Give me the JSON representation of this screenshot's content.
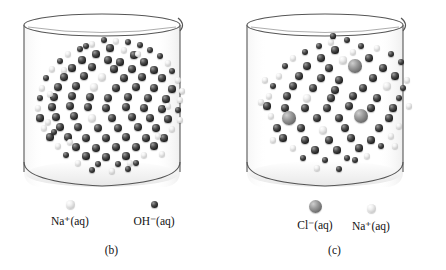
{
  "figure": {
    "type": "chemistry-illustration",
    "background_color": "#ffffff"
  },
  "panels": [
    {
      "id": "b",
      "caption": "(b)",
      "beaker": {
        "label": "beaker",
        "outline_color": "#3a3a3a",
        "fill_color": "#ffffff"
      },
      "legend": [
        {
          "label": "Na",
          "charge": "+",
          "state": "(aq)",
          "text": "Na⁺(aq)",
          "style": "light",
          "size": 9
        },
        {
          "label": "OH",
          "charge": "−",
          "state": "(aq)",
          "text": "OH⁻(aq)",
          "style": "dark",
          "size": 7
        }
      ],
      "particles": {
        "dark_count": 88,
        "light_count": 26,
        "arrangement": "dense circular cluster suspended in upper portion of beaker"
      }
    },
    {
      "id": "c",
      "caption": "(c)",
      "beaker": {
        "label": "beaker",
        "outline_color": "#3a3a3a",
        "fill_color": "#ffffff"
      },
      "legend": [
        {
          "label": "Cl",
          "charge": "−",
          "state": "(aq)",
          "text": "Cl⁻(aq)",
          "style": "gray",
          "size": 13
        },
        {
          "label": "Na",
          "charge": "+",
          "state": "(aq)",
          "text": "Na⁺(aq)",
          "style": "light",
          "size": 9
        }
      ],
      "particles": {
        "dark_count": 62,
        "light_count": 14,
        "large_gray_count": 4,
        "arrangement": "circular cluster with a few large chloride ions among smaller particles"
      }
    }
  ],
  "chart_data": {
    "type": "scatter",
    "title": "",
    "xlabel": "",
    "ylabel": "",
    "series": [
      {
        "name": "OH⁻(aq)",
        "panel": "b",
        "style": "dark",
        "count": 88,
        "radius_px": 3.5
      },
      {
        "name": "Na⁺(aq)",
        "panel": "b",
        "style": "light",
        "count": 26,
        "radius_px": 4.0
      },
      {
        "name": "Cl⁻(aq)",
        "panel": "c",
        "style": "gray",
        "count": 4,
        "radius_px": 6.5
      },
      {
        "name": "Cl⁻(aq) small",
        "panel": "c",
        "style": "dark",
        "count": 62,
        "radius_px": 3.8
      },
      {
        "name": "Na⁺(aq)",
        "panel": "c",
        "style": "light",
        "count": 14,
        "radius_px": 4.2
      }
    ],
    "points_b": [
      [
        84,
        4,
        "d",
        3.4
      ],
      [
        96,
        5,
        "l",
        3.0
      ],
      [
        108,
        6,
        "d",
        3.2
      ],
      [
        72,
        8,
        "l",
        2.8
      ],
      [
        120,
        9,
        "d",
        3.4
      ],
      [
        60,
        13,
        "d",
        3.4
      ],
      [
        90,
        12,
        "d",
        3.6
      ],
      [
        104,
        14,
        "l",
        3.2
      ],
      [
        130,
        14,
        "d",
        3.4
      ],
      [
        48,
        18,
        "l",
        3.0
      ],
      [
        76,
        18,
        "d",
        3.6
      ],
      [
        114,
        19,
        "d",
        3.6
      ],
      [
        140,
        20,
        "d",
        3.4
      ],
      [
        40,
        25,
        "d",
        3.2
      ],
      [
        62,
        24,
        "d",
        3.6
      ],
      [
        88,
        24,
        "d",
        3.8
      ],
      [
        100,
        26,
        "d",
        3.6
      ],
      [
        124,
        26,
        "d",
        3.6
      ],
      [
        148,
        27,
        "l",
        3.2
      ],
      [
        32,
        33,
        "l",
        3.0
      ],
      [
        52,
        32,
        "d",
        3.6
      ],
      [
        72,
        31,
        "d",
        3.8
      ],
      [
        94,
        33,
        "d",
        3.6
      ],
      [
        112,
        33,
        "d",
        3.8
      ],
      [
        134,
        34,
        "d",
        3.6
      ],
      [
        152,
        35,
        "d",
        3.4
      ],
      [
        26,
        42,
        "d",
        3.2
      ],
      [
        44,
        41,
        "d",
        3.8
      ],
      [
        64,
        40,
        "d",
        3.8
      ],
      [
        82,
        41,
        "l",
        4.2
      ],
      [
        104,
        42,
        "d",
        3.8
      ],
      [
        122,
        41,
        "d",
        3.8
      ],
      [
        142,
        42,
        "d",
        3.6
      ],
      [
        158,
        44,
        "l",
        3.2
      ],
      [
        22,
        52,
        "l",
        3.0
      ],
      [
        38,
        51,
        "d",
        3.8
      ],
      [
        56,
        50,
        "d",
        3.8
      ],
      [
        74,
        51,
        "l",
        4.4
      ],
      [
        96,
        52,
        "d",
        3.8
      ],
      [
        116,
        51,
        "d",
        3.8
      ],
      [
        134,
        52,
        "d",
        3.8
      ],
      [
        152,
        53,
        "d",
        3.6
      ],
      [
        20,
        62,
        "d",
        3.4
      ],
      [
        34,
        61,
        "d",
        3.8
      ],
      [
        52,
        60,
        "d",
        4.0
      ],
      [
        70,
        61,
        "d",
        4.0
      ],
      [
        88,
        62,
        "d",
        4.0
      ],
      [
        108,
        61,
        "d",
        3.8
      ],
      [
        128,
        62,
        "d",
        3.8
      ],
      [
        146,
        63,
        "d",
        3.6
      ],
      [
        160,
        64,
        "l",
        3.0
      ],
      [
        18,
        72,
        "l",
        3.2
      ],
      [
        32,
        71,
        "d",
        3.8
      ],
      [
        50,
        70,
        "d",
        4.0
      ],
      [
        68,
        71,
        "d",
        4.0
      ],
      [
        86,
        72,
        "d",
        4.0
      ],
      [
        106,
        71,
        "d",
        4.0
      ],
      [
        124,
        72,
        "d",
        3.8
      ],
      [
        142,
        73,
        "d",
        3.8
      ],
      [
        158,
        74,
        "d",
        3.4
      ],
      [
        20,
        82,
        "d",
        3.6
      ],
      [
        36,
        81,
        "d",
        3.8
      ],
      [
        54,
        80,
        "d",
        4.0
      ],
      [
        72,
        82,
        "l",
        4.4
      ],
      [
        92,
        82,
        "d",
        4.0
      ],
      [
        112,
        81,
        "d",
        4.0
      ],
      [
        130,
        82,
        "d",
        3.8
      ],
      [
        148,
        83,
        "d",
        3.6
      ],
      [
        24,
        92,
        "l",
        3.2
      ],
      [
        40,
        91,
        "d",
        3.8
      ],
      [
        58,
        91,
        "d",
        4.0
      ],
      [
        78,
        92,
        "d",
        4.0
      ],
      [
        98,
        92,
        "d",
        4.0
      ],
      [
        118,
        91,
        "d",
        3.8
      ],
      [
        136,
        92,
        "d",
        3.8
      ],
      [
        152,
        93,
        "l",
        3.2
      ],
      [
        30,
        101,
        "d",
        3.6
      ],
      [
        48,
        101,
        "d",
        3.8
      ],
      [
        66,
        102,
        "d",
        4.0
      ],
      [
        86,
        102,
        "d",
        4.0
      ],
      [
        106,
        101,
        "d",
        3.8
      ],
      [
        126,
        102,
        "d",
        3.8
      ],
      [
        144,
        102,
        "d",
        3.6
      ],
      [
        38,
        110,
        "l",
        3.2
      ],
      [
        56,
        111,
        "d",
        3.8
      ],
      [
        76,
        112,
        "d",
        3.8
      ],
      [
        96,
        111,
        "d",
        3.8
      ],
      [
        116,
        111,
        "d",
        3.8
      ],
      [
        134,
        110,
        "d",
        3.6
      ],
      [
        46,
        119,
        "d",
        3.4
      ],
      [
        66,
        120,
        "d",
        3.6
      ],
      [
        86,
        121,
        "d",
        3.6
      ],
      [
        106,
        120,
        "d",
        3.6
      ],
      [
        124,
        119,
        "l",
        3.2
      ],
      [
        58,
        127,
        "l",
        3.0
      ],
      [
        78,
        128,
        "d",
        3.4
      ],
      [
        98,
        128,
        "d",
        3.4
      ],
      [
        116,
        127,
        "d",
        3.2
      ],
      [
        72,
        134,
        "d",
        3.0
      ],
      [
        92,
        135,
        "l",
        2.8
      ],
      [
        108,
        133,
        "d",
        3.0
      ],
      [
        30,
        58,
        "l",
        3.0
      ],
      [
        44,
        34,
        "l",
        3.0
      ],
      [
        148,
        70,
        "l",
        3.0
      ],
      [
        162,
        55,
        "l",
        2.8
      ],
      [
        138,
        100,
        "l",
        3.0
      ],
      [
        50,
        106,
        "l",
        3.0
      ],
      [
        28,
        86,
        "l",
        3.0
      ],
      [
        118,
        18,
        "l",
        2.8
      ],
      [
        66,
        10,
        "d",
        3.0
      ],
      [
        110,
        127,
        "l",
        3.0
      ],
      [
        142,
        118,
        "l",
        3.0
      ],
      [
        34,
        96,
        "d",
        3.4
      ],
      [
        160,
        84,
        "l",
        3.0
      ]
    ],
    "points_c": [
      [
        88,
        6,
        "l",
        3.2
      ],
      [
        104,
        4,
        "d",
        3.0
      ],
      [
        76,
        10,
        "d",
        3.4
      ],
      [
        118,
        10,
        "d",
        3.4
      ],
      [
        134,
        12,
        "l",
        3.0
      ],
      [
        62,
        16,
        "d",
        3.4
      ],
      [
        92,
        14,
        "d",
        3.6
      ],
      [
        110,
        16,
        "l",
        3.4
      ],
      [
        148,
        18,
        "d",
        3.2
      ],
      [
        50,
        22,
        "l",
        3.0
      ],
      [
        78,
        22,
        "d",
        3.8
      ],
      [
        100,
        24,
        "l",
        3.6
      ],
      [
        126,
        22,
        "d",
        3.8
      ],
      [
        158,
        26,
        "d",
        3.2
      ],
      [
        42,
        30,
        "d",
        3.4
      ],
      [
        64,
        30,
        "d",
        3.8
      ],
      [
        86,
        32,
        "d",
        3.8
      ],
      [
        112,
        30,
        "g",
        6.8
      ],
      [
        140,
        32,
        "d",
        3.8
      ],
      [
        36,
        40,
        "l",
        3.2
      ],
      [
        56,
        40,
        "d",
        3.8
      ],
      [
        78,
        42,
        "d",
        4.0
      ],
      [
        96,
        44,
        "d",
        3.8
      ],
      [
        130,
        42,
        "d",
        3.8
      ],
      [
        152,
        40,
        "d",
        3.6
      ],
      [
        30,
        50,
        "d",
        3.4
      ],
      [
        50,
        50,
        "d",
        4.0
      ],
      [
        70,
        52,
        "d",
        4.0
      ],
      [
        92,
        54,
        "d",
        3.8
      ],
      [
        120,
        52,
        "d",
        4.0
      ],
      [
        144,
        50,
        "l",
        4.2
      ],
      [
        160,
        52,
        "d",
        3.4
      ],
      [
        26,
        60,
        "l",
        3.2
      ],
      [
        44,
        60,
        "d",
        4.0
      ],
      [
        64,
        62,
        "l",
        4.4
      ],
      [
        88,
        62,
        "d",
        4.0
      ],
      [
        110,
        60,
        "d",
        4.0
      ],
      [
        134,
        62,
        "d",
        3.8
      ],
      [
        156,
        62,
        "d",
        3.4
      ],
      [
        24,
        70,
        "d",
        3.6
      ],
      [
        42,
        72,
        "d",
        4.0
      ],
      [
        62,
        72,
        "d",
        4.0
      ],
      [
        84,
        72,
        "d",
        4.0
      ],
      [
        106,
        70,
        "d",
        4.0
      ],
      [
        128,
        72,
        "d",
        3.8
      ],
      [
        150,
        72,
        "d",
        3.6
      ],
      [
        28,
        80,
        "l",
        3.2
      ],
      [
        46,
        82,
        "g",
        6.8
      ],
      [
        74,
        82,
        "d",
        4.0
      ],
      [
        96,
        82,
        "d",
        4.0
      ],
      [
        118,
        80,
        "g",
        7.0
      ],
      [
        146,
        82,
        "d",
        3.6
      ],
      [
        34,
        92,
        "d",
        3.8
      ],
      [
        58,
        92,
        "d",
        4.0
      ],
      [
        80,
        94,
        "l",
        4.4
      ],
      [
        102,
        92,
        "d",
        4.0
      ],
      [
        136,
        92,
        "d",
        3.8
      ],
      [
        156,
        90,
        "l",
        3.2
      ],
      [
        40,
        102,
        "d",
        3.6
      ],
      [
        62,
        104,
        "d",
        3.8
      ],
      [
        86,
        104,
        "d",
        3.8
      ],
      [
        108,
        102,
        "d",
        3.8
      ],
      [
        128,
        104,
        "d",
        3.6
      ],
      [
        148,
        100,
        "l",
        3.2
      ],
      [
        50,
        112,
        "l",
        3.2
      ],
      [
        72,
        114,
        "d",
        3.6
      ],
      [
        94,
        114,
        "d",
        3.6
      ],
      [
        116,
        112,
        "d",
        3.6
      ],
      [
        138,
        110,
        "d",
        3.4
      ],
      [
        60,
        122,
        "d",
        3.2
      ],
      [
        82,
        124,
        "d",
        3.4
      ],
      [
        104,
        122,
        "d",
        3.4
      ],
      [
        124,
        120,
        "l",
        3.0
      ],
      [
        74,
        132,
        "l",
        2.8
      ],
      [
        96,
        133,
        "d",
        3.0
      ],
      [
        22,
        44,
        "l",
        2.8
      ],
      [
        164,
        44,
        "l",
        2.8
      ],
      [
        18,
        66,
        "l",
        2.8
      ],
      [
        166,
        70,
        "l",
        2.8
      ],
      [
        30,
        104,
        "l",
        2.8
      ],
      [
        152,
        110,
        "l",
        2.8
      ],
      [
        90,
        0,
        "d",
        2.6
      ],
      [
        112,
        124,
        "d",
        3.0
      ]
    ]
  }
}
